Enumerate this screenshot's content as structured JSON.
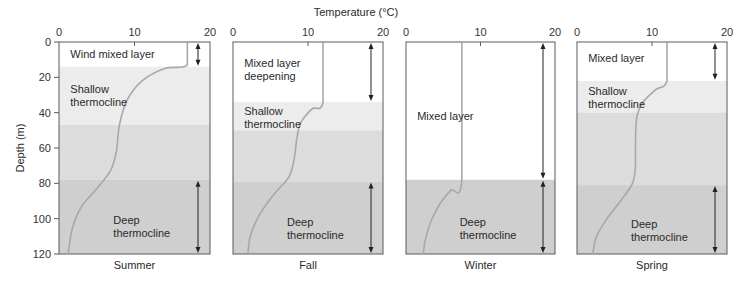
{
  "title": "Temperature (°C)",
  "y_axis_title": "Depth (m)",
  "colors": {
    "mixed": "#ffffff",
    "shallow": "#ececec",
    "mid": "#dcdcdc",
    "deep": "#cfcfcf",
    "profile": "#a8a8a8",
    "frame": "#5a5a5a",
    "arrow": "#222222"
  },
  "chart_data": {
    "type": "line",
    "title": "Temperature (°C)",
    "xlabel": "Temperature (°C)",
    "ylabel": "Depth (m)",
    "xlim": [
      0,
      20
    ],
    "ylim": [
      120,
      0
    ],
    "x_ticks": [
      0,
      10,
      20
    ],
    "y_ticks": [
      0,
      20,
      40,
      60,
      80,
      100,
      120
    ],
    "grid": false,
    "panels": [
      {
        "name": "Summer",
        "regions": [
          {
            "label": "Wind mixed layer",
            "from": 0,
            "to": 14,
            "shade": "mixed",
            "label_depth": 4,
            "label_temp": 1.5
          },
          {
            "label": "Shallow thermocline",
            "from": 14,
            "to": 47,
            "shade": "shallow",
            "label_depth": 24,
            "label_temp": 1.5
          },
          {
            "label": "",
            "from": 47,
            "to": 78,
            "shade": "mid"
          },
          {
            "label": "Deep thermocline",
            "from": 78,
            "to": 120,
            "shade": "deep",
            "label_depth": 98,
            "label_temp": 7.2
          }
        ],
        "arrows": [
          [
            0,
            14
          ],
          [
            78,
            120
          ]
        ],
        "profile": [
          [
            17,
            0
          ],
          [
            17,
            13
          ],
          [
            14,
            15
          ],
          [
            11,
            22
          ],
          [
            9,
            33
          ],
          [
            8,
            47
          ],
          [
            7.6,
            62
          ],
          [
            6.8,
            73
          ],
          [
            5,
            83
          ],
          [
            3,
            93
          ],
          [
            1.8,
            105
          ],
          [
            1.2,
            120
          ]
        ]
      },
      {
        "name": "Fall",
        "regions": [
          {
            "label": "Mixed layer deepening",
            "from": 0,
            "to": 34,
            "shade": "mixed",
            "label_depth": 9,
            "label_temp": 1.5
          },
          {
            "label": "Shallow thermocline",
            "from": 34,
            "to": 50,
            "shade": "shallow",
            "label_depth": 36,
            "label_temp": 1.5
          },
          {
            "label": "",
            "from": 50,
            "to": 79,
            "shade": "mid"
          },
          {
            "label": "Deep thermocline",
            "from": 79,
            "to": 120,
            "shade": "deep",
            "label_depth": 99,
            "label_temp": 7.2
          }
        ],
        "arrows": [
          [
            0,
            34
          ]
        ],
        "arrows_deep": [
          [
            79,
            120
          ]
        ],
        "profile": [
          [
            12,
            0
          ],
          [
            12,
            34
          ],
          [
            10.5,
            38
          ],
          [
            9,
            46
          ],
          [
            8.5,
            55
          ],
          [
            8.2,
            65
          ],
          [
            7.5,
            76
          ],
          [
            5.5,
            86
          ],
          [
            3.5,
            98
          ],
          [
            2.3,
            110
          ],
          [
            2,
            120
          ]
        ]
      },
      {
        "name": "Winter",
        "regions": [
          {
            "label": "Mixed layer",
            "from": 0,
            "to": 78,
            "shade": "mixed",
            "label_depth": 39,
            "label_temp": 1.5
          },
          {
            "label": "Deep thermocline",
            "from": 78,
            "to": 120,
            "shade": "deep",
            "label_depth": 99,
            "label_temp": 7.2
          }
        ],
        "arrows": [
          [
            0,
            78
          ],
          [
            78,
            120
          ]
        ],
        "profile": [
          [
            7.5,
            0
          ],
          [
            7.5,
            78
          ],
          [
            6,
            84
          ],
          [
            4.5,
            92
          ],
          [
            3.3,
            102
          ],
          [
            2.6,
            112
          ],
          [
            2.3,
            120
          ]
        ]
      },
      {
        "name": "Spring",
        "regions": [
          {
            "label": "Mixed layer",
            "from": 0,
            "to": 22,
            "shade": "mixed",
            "label_depth": 6,
            "label_temp": 1.5
          },
          {
            "label": "Shallow thermocline",
            "from": 22,
            "to": 40,
            "shade": "shallow",
            "label_depth": 25,
            "label_temp": 1.5
          },
          {
            "label": "",
            "from": 40,
            "to": 81,
            "shade": "mid"
          },
          {
            "label": "Deep thermocline",
            "from": 81,
            "to": 120,
            "shade": "deep",
            "label_depth": 100,
            "label_temp": 7.2
          }
        ],
        "arrows": [
          [
            0,
            22
          ],
          [
            81,
            120
          ]
        ],
        "profile": [
          [
            12,
            0
          ],
          [
            12,
            22
          ],
          [
            10.5,
            27
          ],
          [
            8.8,
            34
          ],
          [
            8,
            42
          ],
          [
            7.8,
            55
          ],
          [
            7.8,
            70
          ],
          [
            7.4,
            80
          ],
          [
            5.8,
            90
          ],
          [
            4,
            100
          ],
          [
            2.6,
            110
          ],
          [
            2.1,
            120
          ]
        ]
      }
    ]
  }
}
